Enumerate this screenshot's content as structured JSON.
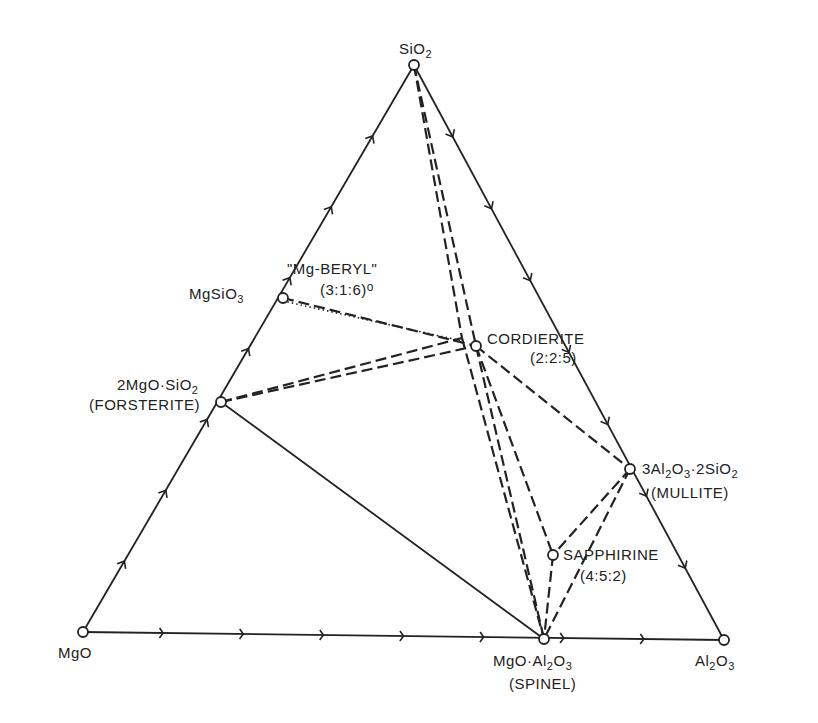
{
  "diagram": {
    "type": "ternary-phase-diagram",
    "system": "MgO-Al2O3-SiO2",
    "colors": {
      "ink": "#222222",
      "background": "#ffffff"
    },
    "vertices": [
      {
        "id": "sio2",
        "label": "SiO",
        "sub": "2",
        "x": 414,
        "y": 65
      },
      {
        "id": "mgo",
        "label": "MgO",
        "sub": "",
        "x": 83,
        "y": 632
      },
      {
        "id": "al2o3",
        "label": "Al",
        "sub": "2",
        "label2": "O",
        "sub2": "3",
        "x": 724,
        "y": 640
      }
    ],
    "compounds": [
      {
        "id": "mgsio3",
        "x": 283,
        "y": 298
      },
      {
        "id": "forsterite",
        "x": 221,
        "y": 402
      },
      {
        "id": "mgberyl",
        "x": 462,
        "y": 338
      },
      {
        "id": "cordierite",
        "x": 476,
        "y": 346
      },
      {
        "id": "mullite",
        "x": 630,
        "y": 469
      },
      {
        "id": "sapphirine",
        "x": 553,
        "y": 555
      },
      {
        "id": "spinel",
        "x": 544,
        "y": 639
      }
    ],
    "labels": {
      "sio2": "SiO",
      "sio2_sub": "2",
      "mgo": "MgO",
      "al2o3_a": "Al",
      "al2o3_sub1": "2",
      "al2o3_b": "O",
      "al2o3_sub2": "3",
      "mgsio3_a": "MgSiO",
      "mgsio3_sub": "3",
      "mgberyl_name": "\"Mg-BERYL\"",
      "mgberyl_ratio": "(3:1:6)",
      "mgberyl_marker": "o",
      "cordierite_name": "CORDIERITE",
      "cordierite_ratio": "(2:2:5)",
      "forsterite_a": "2MgO·SiO",
      "forsterite_sub": "2",
      "forsterite_name": "(FORSTERITE)",
      "mullite_a": "3Al",
      "mullite_sub1": "2",
      "mullite_b": "O",
      "mullite_sub2": "3",
      "mullite_c": "·2SiO",
      "mullite_sub3": "2",
      "mullite_name": "(MULLITE)",
      "sapphirine_name": "SAPPHIRINE",
      "sapphirine_ratio": "(4:5:2)",
      "spinel_a": "MgO·Al",
      "spinel_sub1": "2",
      "spinel_b": "O",
      "spinel_sub2": "3",
      "spinel_name": "(SPINEL)"
    },
    "tie_lines": [
      {
        "from": "forsterite",
        "to": "spinel",
        "style": "solid"
      },
      {
        "from": "sio2",
        "to": "cordierite",
        "style": "dashed"
      },
      {
        "from": "sio2",
        "to": "mgberyl",
        "style": "dashed"
      },
      {
        "from": "mgsio3",
        "to": "cordierite",
        "style": "dashed"
      },
      {
        "from": "mgsio3",
        "to": "mgberyl",
        "style": "dotted"
      },
      {
        "from": "forsterite",
        "to": "cordierite",
        "style": "dashed"
      },
      {
        "from": "forsterite",
        "to": "mgberyl",
        "style": "dashed"
      },
      {
        "from": "cordierite",
        "to": "mullite",
        "style": "dashed"
      },
      {
        "from": "cordierite",
        "to": "spinel",
        "style": "dashed"
      },
      {
        "from": "mgberyl",
        "to": "spinel",
        "style": "dashed"
      },
      {
        "from": "cordierite",
        "to": "sapphirine",
        "style": "dashed"
      },
      {
        "from": "mullite",
        "to": "sapphirine",
        "style": "dashed"
      },
      {
        "from": "mullite",
        "to": "spinel",
        "style": "dashed"
      },
      {
        "from": "sapphirine",
        "to": "spinel",
        "style": "dashed"
      }
    ],
    "edge_ticks": {
      "left_edge_count": 7,
      "right_edge_count": 7,
      "bottom_edge_count": 7
    }
  }
}
